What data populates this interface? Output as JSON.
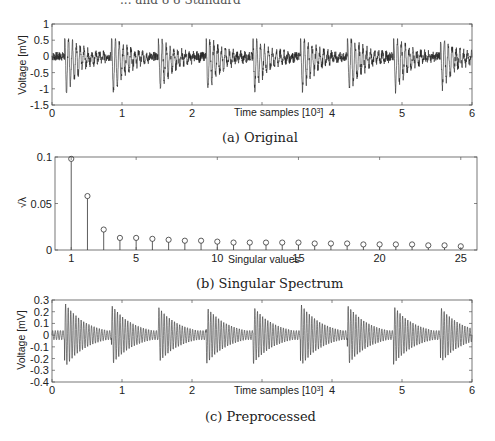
{
  "header_fragment": "... and 8 8 Standard",
  "chart_data": [
    {
      "type": "line",
      "id": "original",
      "caption": "(a) Original",
      "title": "",
      "xlabel": "Time samples [10^3]",
      "ylabel": "Voltage [mV]",
      "xlim": [
        0,
        6
      ],
      "ylim": [
        -1.5,
        1
      ],
      "xticks": [
        0,
        1,
        2,
        3,
        4,
        5,
        6
      ],
      "xtick_labels": [
        "0",
        "1",
        "2",
        "",
        "4",
        "5",
        "6"
      ],
      "yticks": [
        -1.5,
        -1,
        -0.5,
        0,
        0.5,
        1
      ],
      "ytick_labels": [
        "-1.5",
        "-1",
        "-0.5",
        "0",
        "0.5",
        "1"
      ],
      "grid": false,
      "description": "Noisy quasi-periodic ECG-like signal, baseline near 0 with high-frequency noise (~±0.2), sharp negative deflections to about -1.2 occurring roughly every 0.67 x10^3 samples, followed by decaying oscillations.",
      "beat_onsets": [
        0.18,
        0.85,
        1.52,
        2.2,
        2.87,
        3.55,
        4.22,
        4.88,
        5.55
      ],
      "beat_minima": [
        -1.3,
        -1.3,
        -1.1,
        -1.15,
        -1.15,
        -1.2,
        -1.25,
        -1.2,
        -1.1
      ],
      "noise_amplitude": 0.2
    },
    {
      "type": "stem",
      "id": "singular_spectrum",
      "caption": "(b) Singular Spectrum",
      "title": "",
      "xlabel": "Singular values",
      "ylabel": "√λ",
      "xlim": [
        0,
        26
      ],
      "ylim": [
        0,
        0.1
      ],
      "xticks": [
        1,
        5,
        10,
        15,
        20,
        25
      ],
      "xtick_labels": [
        "1",
        "5",
        "10",
        "15",
        "20",
        "25"
      ],
      "yticks": [
        0,
        0.05,
        0.1
      ],
      "ytick_labels": [
        "0",
        "0.05",
        "0.1"
      ],
      "grid": false,
      "x": [
        1,
        2,
        3,
        4,
        5,
        6,
        7,
        8,
        9,
        10,
        11,
        12,
        13,
        14,
        15,
        16,
        17,
        18,
        19,
        20,
        21,
        22,
        23,
        24,
        25
      ],
      "values": [
        0.098,
        0.058,
        0.022,
        0.013,
        0.013,
        0.012,
        0.011,
        0.01,
        0.01,
        0.009,
        0.008,
        0.008,
        0.008,
        0.008,
        0.008,
        0.007,
        0.007,
        0.007,
        0.006,
        0.006,
        0.006,
        0.006,
        0.005,
        0.005,
        0.004
      ]
    },
    {
      "type": "line",
      "id": "preprocessed",
      "caption": "(c) Preprocessed",
      "title": "",
      "xlabel": "Time samples [10^3]",
      "ylabel": "Voltage [mV]",
      "xlim": [
        0,
        6
      ],
      "ylim": [
        -0.4,
        0.3
      ],
      "xticks": [
        0,
        1,
        2,
        3,
        4,
        5,
        6
      ],
      "xtick_labels": [
        "0",
        "1",
        "2",
        "",
        "4",
        "5",
        "6"
      ],
      "yticks": [
        -0.4,
        -0.3,
        -0.2,
        -0.1,
        0,
        0.1,
        0.2,
        0.3
      ],
      "ytick_labels": [
        "-0.4",
        "-0.3",
        "-0.2",
        "-0.1",
        "0",
        "0.1",
        "0.2",
        "0.3"
      ],
      "grid": false,
      "description": "Filtered oscillatory signal with bursts of amplitude ~±0.25-0.3 starting every ~0.67 x10^3 samples and decaying to ~±0.05 between bursts.",
      "beat_onsets": [
        0.18,
        0.85,
        1.52,
        2.2,
        2.87,
        3.55,
        4.22,
        4.88,
        5.55
      ],
      "peak_amplitude": [
        0.28,
        0.26,
        0.24,
        0.25,
        0.25,
        0.27,
        0.26,
        0.25,
        0.24
      ]
    }
  ]
}
